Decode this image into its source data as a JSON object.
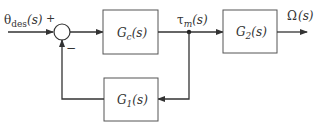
{
  "diagram": {
    "type": "block-diagram",
    "colors": {
      "line": "#333333",
      "background": "#ffffff"
    },
    "input": {
      "symbol": "θ",
      "subscript": "des",
      "arg": "(s)",
      "sign": "+"
    },
    "summing_junction": {
      "feedback_sign": "−"
    },
    "blocks": {
      "controller": {
        "name": "G",
        "subscript": "c",
        "arg": "(s)"
      },
      "plant": {
        "name": "G",
        "subscript": "2",
        "arg": "(s)"
      },
      "feedback": {
        "name": "G",
        "subscript": "1",
        "arg": "(s)"
      }
    },
    "signals": {
      "intermediate": {
        "symbol": "τ",
        "subscript": "m",
        "arg": "(s)"
      },
      "output": {
        "symbol": "Ω",
        "arg": "(s)"
      }
    }
  }
}
